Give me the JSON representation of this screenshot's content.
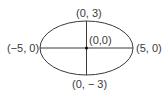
{
  "diagram": {
    "shape": "ellipse",
    "center": {
      "x": 0,
      "y": 0
    },
    "semi_major_axis": 5,
    "semi_minor_axis": 3,
    "stroke_color": "#3a3a3a",
    "labels": {
      "top": "(0, 3)",
      "bottom": "(0, − 3)",
      "left": "(−5, 0)",
      "right": "(5, 0)",
      "center": "(0,0)"
    }
  }
}
